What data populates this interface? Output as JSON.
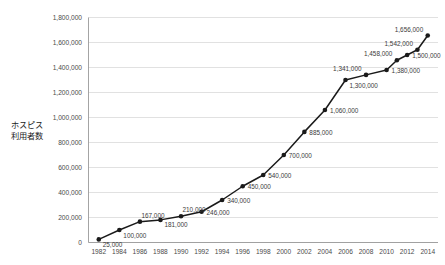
{
  "chart_data": {
    "type": "line",
    "title": "",
    "xlabel": "",
    "ylabel": "ホスピス\n利用者数",
    "ylabel_line1": "ホスピス",
    "ylabel_line2": "利用者数",
    "ylim": [
      0,
      1800000
    ],
    "ytick_step": 200000,
    "ytick_labels": [
      "0",
      "200,000",
      "400,000",
      "600,000",
      "800,000",
      "1,000,000",
      "1,200,000",
      "1,400,000",
      "1,600,000",
      "1,800,000"
    ],
    "ytick_values": [
      0,
      200000,
      400000,
      600000,
      800000,
      1000000,
      1200000,
      1400000,
      1600000,
      1800000
    ],
    "xlim": [
      1981,
      2015
    ],
    "xtick_labels": [
      "1982",
      "1984",
      "1986",
      "1988",
      "1990",
      "1992",
      "1994",
      "1996",
      "1998",
      "2000",
      "2002",
      "2004",
      "2006",
      "2008",
      "2010",
      "2012",
      "2014"
    ],
    "xtick_values": [
      1982,
      1984,
      1986,
      1988,
      1990,
      1992,
      1994,
      1996,
      1998,
      2000,
      2002,
      2004,
      2006,
      2008,
      2010,
      2012,
      2014
    ],
    "grid": "horizontal",
    "legend": "none",
    "marker": "filled-circle",
    "line_color": "#1a1a1a",
    "grid_color": "#d4d4d4",
    "x": [
      1982,
      1984,
      1986,
      1988,
      1990,
      1992,
      1994,
      1996,
      1998,
      2000,
      2002,
      2004,
      2006,
      2008,
      2010,
      2011,
      2012,
      2013,
      2014
    ],
    "values": [
      25000,
      100000,
      167000,
      181000,
      210000,
      246000,
      340000,
      450000,
      540000,
      700000,
      885000,
      1060000,
      1300000,
      1341000,
      1380000,
      1458000,
      1500000,
      1542000,
      1656000
    ],
    "point_labels": [
      "25,000",
      "100,000",
      "167,000",
      "181,000",
      "210,000",
      "246,000",
      "340,000",
      "450,000",
      "540,000",
      "700,000",
      "885,000",
      "1,060,000",
      "1,300,000",
      "1,341,000",
      "1,380,000",
      "1,458,000",
      "1,500,000",
      "1,542,000",
      "1,656,000"
    ],
    "label_placement": [
      "below-right",
      "below-right",
      "above-right",
      "below-right",
      "above-right",
      "right",
      "right",
      "right",
      "right",
      "right",
      "right",
      "right",
      "below-right",
      "above-left",
      "right",
      "above-left",
      "right",
      "above-left",
      "above-left"
    ]
  }
}
